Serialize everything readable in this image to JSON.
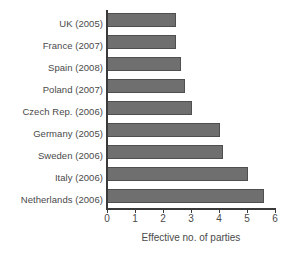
{
  "chart_data": {
    "type": "bar",
    "orientation": "horizontal",
    "title": "",
    "xlabel": "Effective no. of parties",
    "ylabel": "",
    "xlim": [
      0,
      6
    ],
    "xticks": [
      0,
      1,
      2,
      3,
      4,
      5,
      6
    ],
    "xtick_labels": [
      "0",
      "1",
      "2",
      "3",
      "4",
      "5",
      "6"
    ],
    "grid": false,
    "legend": false,
    "categories": [
      "UK (2005)",
      "France (2007)",
      "Spain (2008)",
      "Poland (2007)",
      "Czech Rep. (2006)",
      "Germany (2005)",
      "Sweden (2006)",
      "Italy (2006)",
      "Netherlands (2006)"
    ],
    "values": [
      2.45,
      2.45,
      2.65,
      2.8,
      3.05,
      4.05,
      4.15,
      5.05,
      5.6
    ],
    "bar_color": "#6f6f6f",
    "bar_edge_color": "#4f4f4f",
    "background_color": "#ffffff",
    "axis_color": "#3a3a3a",
    "text_color": "#4a4a4a"
  }
}
